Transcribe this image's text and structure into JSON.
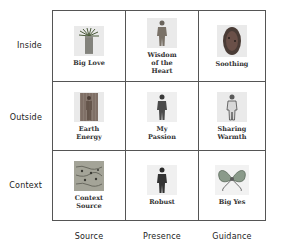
{
  "rows": [
    {
      "label": "Inside"
    },
    {
      "label": "Outside"
    },
    {
      "label": "Context"
    }
  ],
  "columns": [
    {
      "label": "Source"
    },
    {
      "label": "Presence"
    },
    {
      "label": "Guidance"
    }
  ],
  "cells": [
    [
      {
        "caption": "Big Love",
        "icon": "plant-figure-icon"
      },
      {
        "caption": "Wisdom\nof the\nHeart",
        "icon": "human-figure-icon"
      },
      {
        "caption": "Soothing",
        "icon": "oval-glow-icon"
      }
    ],
    [
      {
        "caption": "Earth\nEnergy",
        "icon": "textured-figure-icon"
      },
      {
        "caption": "My\nPassion",
        "icon": "human-figure-icon"
      },
      {
        "caption": "Sharing\nWarmth",
        "icon": "light-figure-icon"
      }
    ],
    [
      {
        "caption": "Context\nSource",
        "icon": "texture-pattern-icon"
      },
      {
        "caption": "Robust",
        "icon": "dark-figure-icon"
      },
      {
        "caption": "Big Yes",
        "icon": "bow-ribbon-icon"
      }
    ]
  ]
}
